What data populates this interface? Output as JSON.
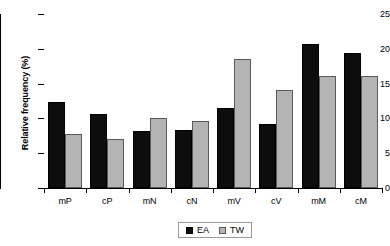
{
  "chart_data": {
    "type": "bar",
    "title": "",
    "subtitle": "",
    "xlabel": "",
    "ylabel": "Relative frequency (%)",
    "categories": [
      "mP",
      "cP",
      "mN",
      "cN",
      "mV",
      "cV",
      "mM",
      "cM"
    ],
    "series": [
      {
        "name": "EA",
        "color": "#0d0d0d",
        "values": [
          12.4,
          10.7,
          8.2,
          8.4,
          11.5,
          9.2,
          20.7,
          19.4
        ]
      },
      {
        "name": "TW",
        "color": "#b4b4b4",
        "values": [
          7.7,
          7.0,
          10.1,
          9.7,
          18.6,
          14.1,
          16.1,
          16.1
        ]
      }
    ],
    "ylim": [
      0,
      25
    ],
    "ytick_labels": [
      "0",
      "5",
      "10",
      "15",
      "20",
      "25"
    ],
    "ytick_values": [
      0,
      5,
      10,
      15,
      20,
      25
    ],
    "grid": false,
    "legend_position": "bottom"
  },
  "legend": {
    "entries": [
      {
        "label": "EA"
      },
      {
        "label": "TW"
      }
    ]
  },
  "colors": {
    "ea": "#0d0d0d",
    "tw": "#b4b4b4",
    "axis": "#000000",
    "background": "#ffffff"
  }
}
